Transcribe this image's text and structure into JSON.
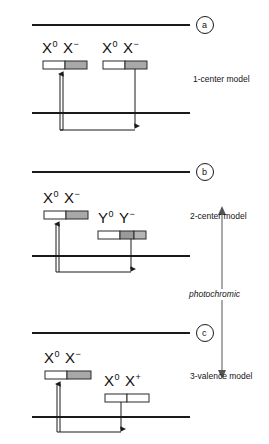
{
  "figure": {
    "width": 269,
    "height": 444,
    "background": "#ffffff",
    "line_color": "#1a1a1a",
    "box_white": "#ffffff",
    "box_gray": "#a8a8a8",
    "box_border": "#2b2b2b"
  },
  "panels": [
    {
      "id": "a",
      "marker": "a",
      "model_label": "1-center model",
      "species": [
        {
          "name": "X",
          "charge_left": "0",
          "charge_right": "−",
          "label_html": "X0 X−"
        },
        {
          "name": "X",
          "charge_left": "0",
          "charge_right": "−",
          "label_html": "X0 X−"
        }
      ]
    },
    {
      "id": "b",
      "marker": "b",
      "model_label": "2-center model",
      "species": [
        {
          "name": "X",
          "charge_left": "0",
          "charge_right": "−",
          "label_html": "X0 X−"
        },
        {
          "name": "Y",
          "charge_left": "0",
          "charge_right": "−",
          "label_html": "Y0 Y−"
        }
      ]
    },
    {
      "id": "c",
      "marker": "c",
      "model_label": "3-valence model",
      "species": [
        {
          "name": "X",
          "charge_left": "0",
          "charge_right": "−",
          "label_html": "X0 X−"
        },
        {
          "name": "X",
          "charge_left": "0",
          "charge_right": "+",
          "label_html": "X0 X+"
        }
      ]
    }
  ],
  "labels": {
    "panel_a_marker": "a",
    "panel_b_marker": "b",
    "panel_c_marker": "c",
    "model_a": "1-center model",
    "model_b": "2-center model",
    "model_c": "3-valence model",
    "photochromic": "photochromic",
    "x_zero": "X",
    "x_zero_sup": "0",
    "x_minus": "X",
    "x_minus_sup": "−",
    "y_zero": "Y",
    "y_zero_sup": "0",
    "y_minus": "Y",
    "y_minus_sup": "−",
    "x_plus": "X",
    "x_plus_sup": "+"
  },
  "species_text": {
    "a_left": {
      "s1": "X",
      "sup1": "0",
      "s2": "X",
      "sup2": "−"
    },
    "a_right": {
      "s1": "X",
      "sup1": "0",
      "s2": "X",
      "sup2": "−"
    },
    "b_left": {
      "s1": "X",
      "sup1": "0",
      "s2": "X",
      "sup2": "−"
    },
    "b_right": {
      "s1": "Y",
      "sup1": "0",
      "s2": "Y",
      "sup2": "−"
    },
    "c_left": {
      "s1": "X",
      "sup1": "0",
      "s2": "X",
      "sup2": "−"
    },
    "c_right": {
      "s1": "X",
      "sup1": "0",
      "s2": "X",
      "sup2": "+"
    }
  }
}
